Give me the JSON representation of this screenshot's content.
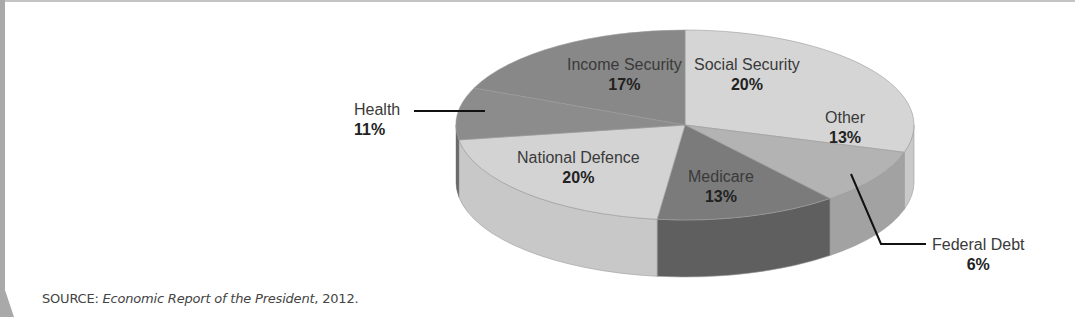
{
  "chart_data": {
    "type": "pie",
    "style": "3d",
    "title": "",
    "slices": [
      {
        "label": "Social Security",
        "value": 20,
        "display": "20%"
      },
      {
        "label": "Other",
        "value": 13,
        "display": "13%"
      },
      {
        "label": "Federal Debt",
        "value": 6,
        "display": "6%"
      },
      {
        "label": "Medicare",
        "value": 13,
        "display": "13%"
      },
      {
        "label": "National Defence",
        "value": 20,
        "display": "20%"
      },
      {
        "label": "Health",
        "value": 11,
        "display": "11%"
      },
      {
        "label": "Income Security",
        "value": 17,
        "display": "17%"
      }
    ],
    "legend": "none (direct labels)"
  },
  "labels": {
    "income_security": {
      "name": "Income Security",
      "pct": "17%"
    },
    "social_security": {
      "name": "Social Security",
      "pct": "20%"
    },
    "health": {
      "name": "Health",
      "pct": "11%"
    },
    "other": {
      "name": "Other",
      "pct": "13%"
    },
    "national_defence": {
      "name": "National Defence",
      "pct": "20%"
    },
    "medicare": {
      "name": "Medicare",
      "pct": "13%"
    },
    "federal_debt": {
      "name": "Federal Debt",
      "pct": "6%"
    }
  },
  "source": {
    "prefix": "SOURCE: ",
    "title": "Economic Report of the President",
    "suffix": ", 2012."
  },
  "geometry": {
    "cx": 685,
    "cy": 125,
    "rx": 229,
    "ry": 95,
    "depth": 57,
    "segments": [
      {
        "key": "social_other",
        "start": 90,
        "end": -16.7,
        "top": "#d5d5d5",
        "side": "#c9c9c9"
      },
      {
        "key": "federal_debt",
        "start": -16.7,
        "end": -50.7,
        "top": "#b3b3b3",
        "side": "#a2a2a2"
      },
      {
        "key": "medicare",
        "start": -50.7,
        "end": -97,
        "top": "#7b7b7b",
        "side": "#5f5f5f"
      },
      {
        "key": "national_defence",
        "start": -97,
        "end": -171,
        "top": "#d3d3d3",
        "side": "#c8c8c8"
      },
      {
        "key": "health",
        "start": -171,
        "end": -203,
        "top": "#8c8c8c",
        "side": "#6f6f6f"
      },
      {
        "key": "income_security",
        "start": -203,
        "end": -270,
        "top": "#888888",
        "side": "#707070"
      }
    ]
  }
}
